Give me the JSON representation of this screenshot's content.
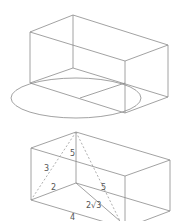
{
  "figures": [
    {
      "id": "box-with-ellipse",
      "description": "Rectangular box in oblique projection with an ellipse at its base",
      "labels": []
    },
    {
      "id": "box-with-diagonals",
      "description": "Rectangular box with dashed space diagonals from top apex",
      "labels": {
        "left_diagonal": "3",
        "vertical_edge": "5",
        "right_diagonal": "5",
        "base_depth": "2",
        "base_diagonal": "2√3",
        "front_bottom": "4"
      }
    }
  ],
  "colors": {
    "line": "#8a8a8a",
    "text": "#555555",
    "background": "#ffffff"
  }
}
